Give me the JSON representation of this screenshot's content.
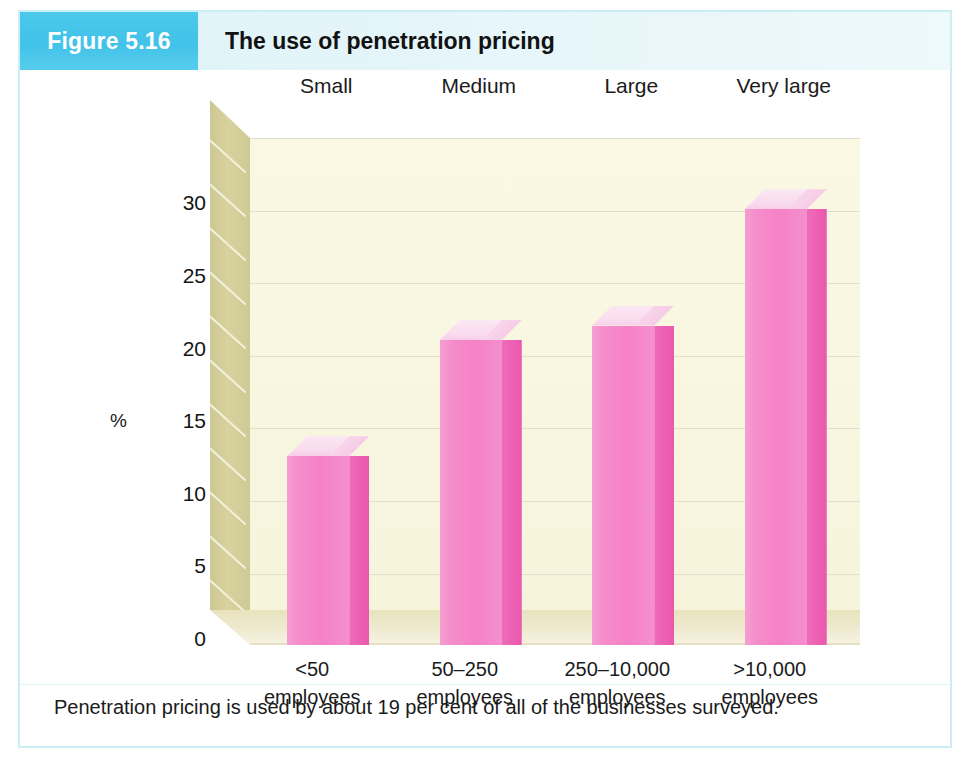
{
  "figure": {
    "badge_label": "Figure 5.16",
    "title": "The use of penetration pricing",
    "caption": "Penetration pricing is used by about 19 per cent of all of the businesses surveyed.",
    "accent_color": "#48c6ea",
    "frame_color": "#cbeef4",
    "bar_front_color": "#f58ecb",
    "bar_side_color": "#ec5fb2",
    "bar_top_color": "#f9dbee",
    "wall_back_color": "#faf7e3",
    "wall_left_color": "#d2cd98",
    "floor_color": "#ebe6c6"
  },
  "chart_data": {
    "type": "bar",
    "title": "The use of penetration pricing",
    "xlabel": "",
    "ylabel": "%",
    "ylim": [
      0,
      32.5
    ],
    "yticks": [
      0,
      5,
      10,
      15,
      20,
      25,
      30
    ],
    "ytick_labels": [
      "0",
      "5",
      "10",
      "15",
      "20",
      "25",
      "30"
    ],
    "gridlines": [
      2.5,
      7.5,
      12.5,
      17.5,
      22.5,
      27.5,
      32.5
    ],
    "grid": true,
    "legend": "none",
    "three_d": true,
    "categories": [
      "<50 employees",
      "50–250 employees",
      "250–10,000 employees",
      ">10,000 employees"
    ],
    "category_size_labels": [
      "Small",
      "Medium",
      "Large",
      "Very large"
    ],
    "categories_line1": [
      "<50",
      "50–250",
      "250–10,000",
      ">10,000"
    ],
    "categories_line2": [
      "employees",
      "employees",
      "employees",
      "employees"
    ],
    "values": [
      13,
      21,
      22,
      30
    ],
    "series": [
      {
        "name": "Penetration pricing usage",
        "values": [
          13,
          21,
          22,
          30
        ]
      }
    ],
    "annotation": "Penetration pricing is used by about 19 per cent of all of the businesses surveyed."
  }
}
